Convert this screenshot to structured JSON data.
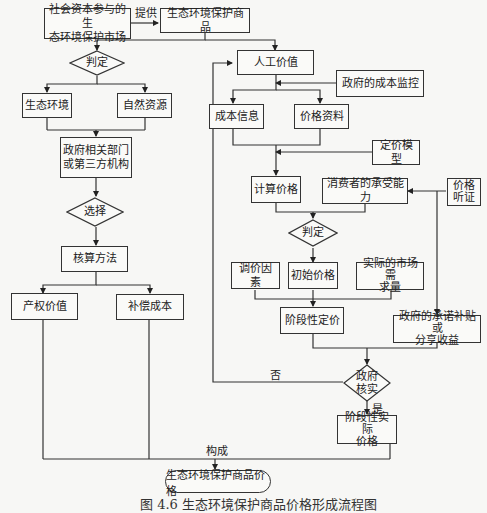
{
  "diagram": {
    "type": "flowchart",
    "caption": "图 4.6   生态环境保护商品价格形成流程图",
    "nodes": {
      "market": "社会资本参与的生态环境保护市场",
      "market_l1": "社会资本参与的生",
      "market_l2": "态环境保护市场",
      "goods": "生态环境保护商品",
      "judge1": "判定",
      "eco_env": "生态环境",
      "nat_res": "自然资源",
      "gov_dept_l1": "政府相关部门",
      "gov_dept_l2": "或第三方机构",
      "choose": "选择",
      "accounting": "核算方法",
      "property_value": "产权价值",
      "compensation_cost": "补偿成本",
      "labor_value": "人工价值",
      "gov_cost_monitor": "政府的成本监控",
      "cost_info": "成本信息",
      "price_data": "价格资料",
      "pricing_model": "定价模型",
      "calc_price": "计算价格",
      "consumer_afford": "消费者的承受能力",
      "price_hearing_l1": "价格",
      "price_hearing_l2": "听证",
      "judge2": "判定",
      "adjust_factors": "调价因素",
      "initial_price": "初始价格",
      "market_demand_l1": "实际的市场需",
      "market_demand_l2": "求量",
      "staged_pricing": "阶段性定价",
      "gov_subsidy_l1": "政府的承诺补贴或",
      "gov_subsidy_l2": "分享收益",
      "gov_verify_l1": "政府",
      "gov_verify_l2": "核实",
      "staged_actual_l1": "阶段性实际",
      "staged_actual_l2": "价格",
      "final_price": "生态环境保护商品价格"
    },
    "edge_labels": {
      "provide": "提供",
      "no": "否",
      "yes": "是",
      "compose": "构成"
    },
    "edges": [
      {
        "from": "market",
        "to": "goods",
        "label": "提供"
      },
      {
        "from": "goods",
        "to": "judge1"
      },
      {
        "from": "goods",
        "to": "labor_value"
      },
      {
        "from": "judge1",
        "to": "eco_env"
      },
      {
        "from": "judge1",
        "to": "nat_res"
      },
      {
        "from": "eco_env",
        "to": "gov_dept"
      },
      {
        "from": "nat_res",
        "to": "gov_dept"
      },
      {
        "from": "gov_dept",
        "to": "choose"
      },
      {
        "from": "choose",
        "to": "accounting"
      },
      {
        "from": "accounting",
        "to": "property_value"
      },
      {
        "from": "accounting",
        "to": "compensation_cost"
      },
      {
        "from": "gov_cost_monitor",
        "to": "labor_value"
      },
      {
        "from": "labor_value",
        "to": "cost_info"
      },
      {
        "from": "labor_value",
        "to": "price_data"
      },
      {
        "from": "cost_info",
        "to": "calc_price"
      },
      {
        "from": "price_data",
        "to": "calc_price"
      },
      {
        "from": "pricing_model",
        "to": "calc_price"
      },
      {
        "from": "price_hearing",
        "to": "consumer_afford"
      },
      {
        "from": "price_hearing",
        "to": "gov_subsidy"
      },
      {
        "from": "calc_price",
        "to": "judge2"
      },
      {
        "from": "consumer_afford",
        "to": "judge2"
      },
      {
        "from": "judge2",
        "to": "initial_price"
      },
      {
        "from": "adjust_factors",
        "to": "staged_pricing"
      },
      {
        "from": "initial_price",
        "to": "staged_pricing"
      },
      {
        "from": "market_demand",
        "to": "staged_pricing"
      },
      {
        "from": "staged_pricing",
        "to": "gov_verify"
      },
      {
        "from": "gov_subsidy",
        "to": "gov_verify"
      },
      {
        "from": "gov_verify",
        "to": "labor_value",
        "label": "否"
      },
      {
        "from": "gov_verify",
        "to": "staged_actual",
        "label": "是"
      },
      {
        "from": "property_value",
        "to": "final_price",
        "label": "构成"
      },
      {
        "from": "compensation_cost",
        "to": "final_price",
        "label": "构成"
      },
      {
        "from": "staged_actual",
        "to": "final_price",
        "label": "构成"
      }
    ]
  }
}
